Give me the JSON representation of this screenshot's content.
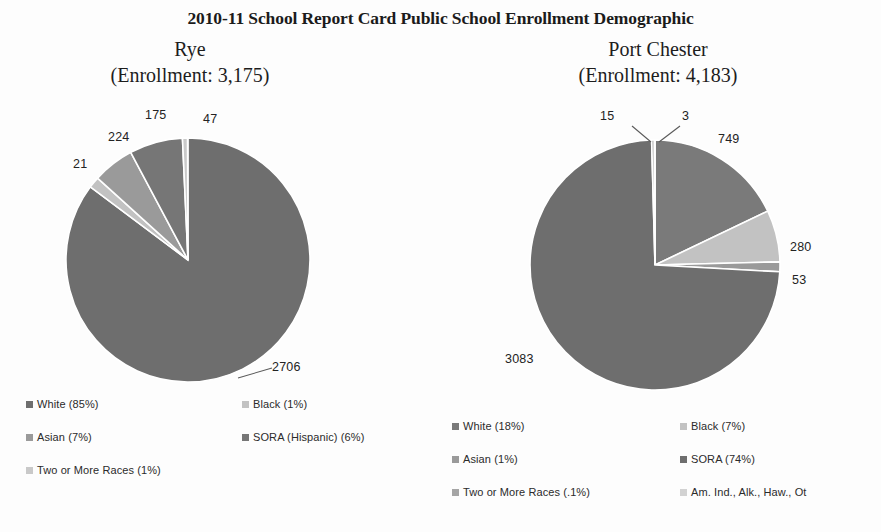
{
  "title": "2010-11 School Report Card Public School Enrollment Demographic",
  "schools": {
    "left": {
      "name": "Rye",
      "enrollment_line": "(Enrollment: 3,175)"
    },
    "right": {
      "name": "Port Chester",
      "enrollment_line": "(Enrollment: 4,183)"
    }
  },
  "colors": {
    "white_slice": "#6e6e6e",
    "black_slice": "#b9b9b9",
    "asian_slice": "#8c8c8c",
    "sora_slice": "#c7c7c7",
    "two_or_more_slice": "#9a9a9a",
    "am_ind_slice": "#d6d6d6",
    "separator": "#ffffff",
    "leader_line": "#5a5a5a",
    "text": "#232323"
  },
  "legends": {
    "left": [
      {
        "label": "White (85%)",
        "color": "#6e6e6e"
      },
      {
        "label": "Black (1%)",
        "color": "#c2c2c2"
      },
      {
        "label": "Asian (7%)",
        "color": "#9a9a9a"
      },
      {
        "label": "SORA (Hispanic) (6%)",
        "color": "#767676"
      },
      {
        "label": "Two or More Races (1%)",
        "color": "#c9c9c9"
      }
    ],
    "right": [
      {
        "label": "White (18%)",
        "color": "#7a7a7a"
      },
      {
        "label": "Black (7%)",
        "color": "#c2c2c2"
      },
      {
        "label": "Asian (1%)",
        "color": "#9a9a9a"
      },
      {
        "label": "SORA (74%)",
        "color": "#6e6e6e"
      },
      {
        "label": "Two or More Races (.1%)",
        "color": "#a5a5a5"
      },
      {
        "label": "Am. Ind., Alk., Haw., Ot",
        "color": "#d2d2d2"
      }
    ]
  },
  "labels": {
    "left": {
      "white": "2706",
      "black": "47",
      "asian": "175",
      "sora": "224",
      "two_or_more": "21"
    },
    "right": {
      "white": "749",
      "black": "280",
      "asian": "53",
      "sora": "3083",
      "two_or_more": "15",
      "am_ind": "3"
    }
  },
  "chart_data": [
    {
      "type": "pie",
      "title": "Rye",
      "subtitle": "(Enrollment: 3,175)",
      "total": 3175,
      "categories": [
        "White",
        "Black",
        "Asian",
        "SORA (Hispanic)",
        "Two or More Races"
      ],
      "values": [
        2706,
        47,
        175,
        224,
        21
      ],
      "percent_labels": [
        "85%",
        "1%",
        "7%",
        "6%",
        "1%"
      ],
      "colors": [
        "#6e6e6e",
        "#c2c2c2",
        "#9a9a9a",
        "#767676",
        "#c9c9c9"
      ],
      "legend_position": "bottom",
      "start_angle_deg": 0,
      "direction": "clockwise"
    },
    {
      "type": "pie",
      "title": "Port Chester",
      "subtitle": "(Enrollment: 4,183)",
      "total": 4183,
      "categories": [
        "White",
        "Black",
        "Asian",
        "SORA",
        "Two or More Races",
        "Am. Ind., Alk., Haw., Ot"
      ],
      "values": [
        749,
        280,
        53,
        3083,
        15,
        3
      ],
      "percent_labels": [
        "18%",
        "7%",
        "1%",
        "74%",
        ".1%",
        ""
      ],
      "colors": [
        "#7a7a7a",
        "#c2c2c2",
        "#9a9a9a",
        "#6e6e6e",
        "#a5a5a5",
        "#d2d2d2"
      ],
      "legend_position": "bottom",
      "start_angle_deg": 0,
      "direction": "clockwise"
    }
  ]
}
